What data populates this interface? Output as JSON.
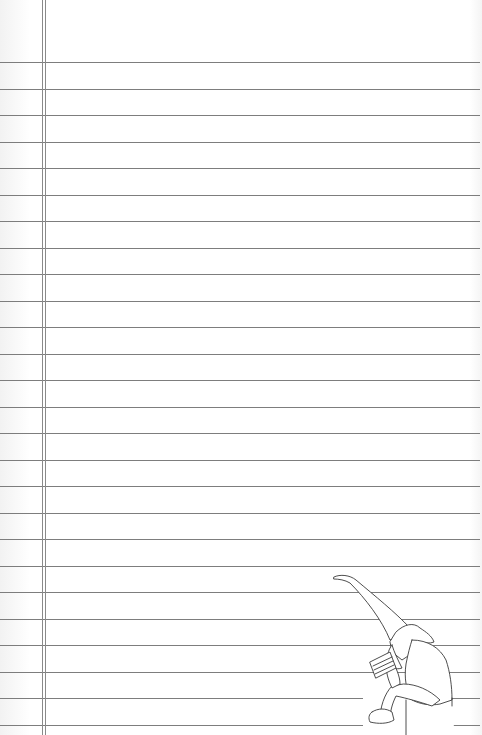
{
  "page": {
    "type": "lined-notebook-paper",
    "background_color": "#ffffff",
    "line_color": "#7d7d7d",
    "margin_line_color": "#8a8a8a"
  },
  "rules": {
    "count": 26,
    "first_y": 62,
    "spacing": 26.52,
    "x_start": 0,
    "x_end": 480
  },
  "margin": {
    "lines_x": [
      42,
      45
    ]
  },
  "illustration": {
    "subject": "gnome-reading-book",
    "description": "Gnome with tall pointed hat sitting on a step reading a book",
    "position": {
      "x": 330,
      "y": 573,
      "width": 152,
      "height": 162
    }
  }
}
